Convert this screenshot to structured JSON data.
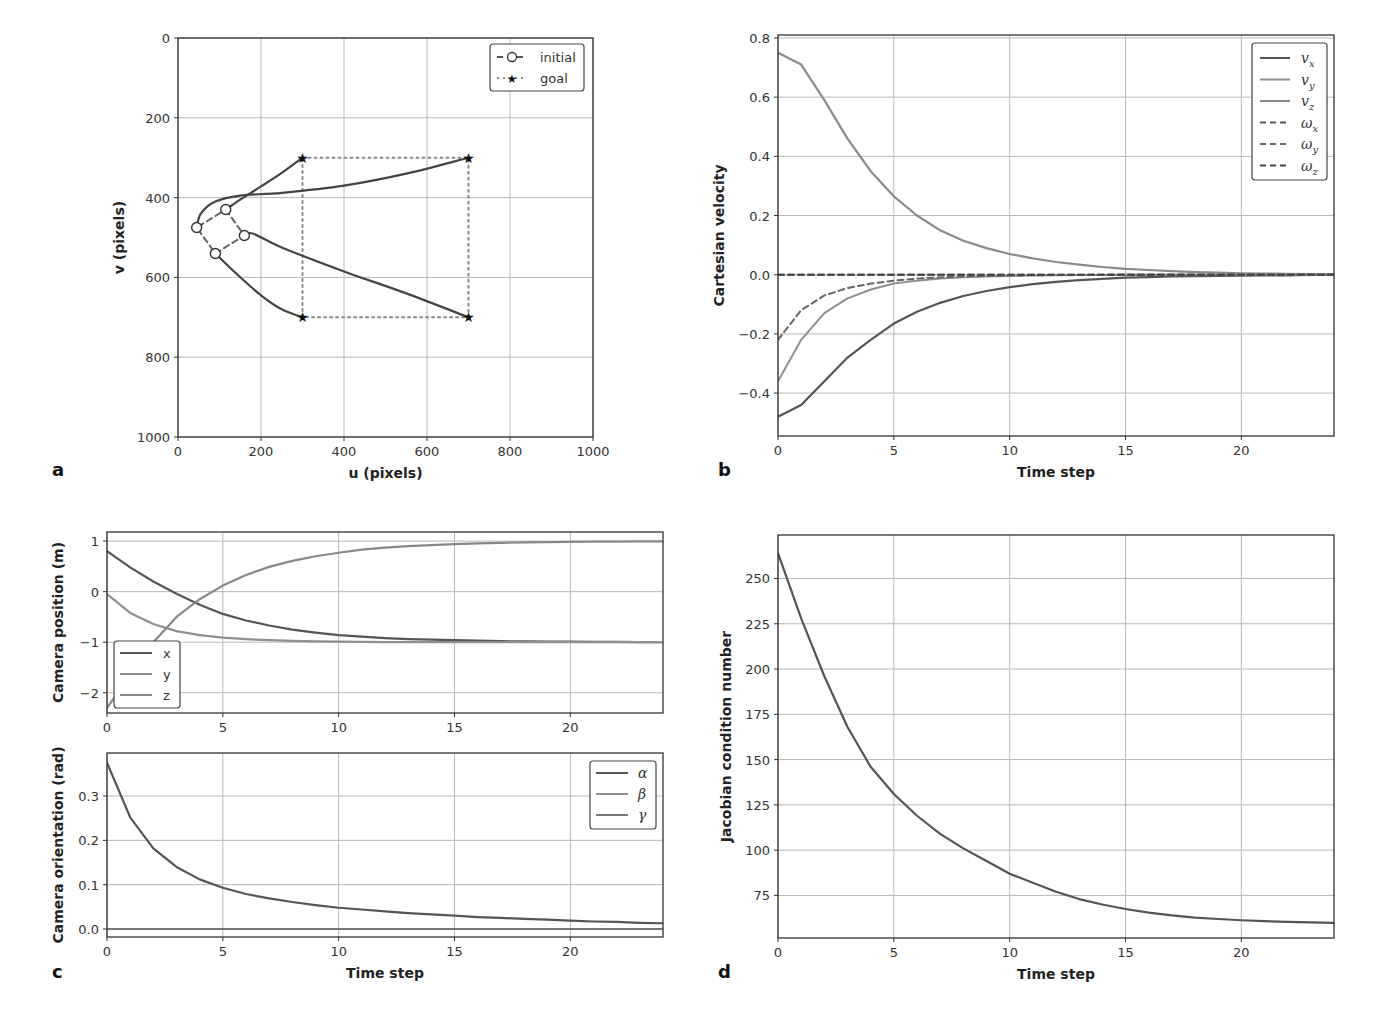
{
  "panels": {
    "a": {
      "letter": "a"
    },
    "b": {
      "letter": "b"
    },
    "c": {
      "letter": "c"
    },
    "d": {
      "letter": "d"
    }
  },
  "colors": {
    "dark": "#555555",
    "mid": "#777777",
    "light": "#8f8f8f",
    "grid": "#b8b8b8",
    "frame": "#333333"
  },
  "chart_data": [
    {
      "id": "a",
      "type": "line",
      "title": "",
      "xlabel": "u (pixels)",
      "ylabel": "v (pixels)",
      "xlim": [
        0,
        1000
      ],
      "ylim": [
        1000,
        0
      ],
      "y_inverted": true,
      "xticks": [
        "0",
        "200",
        "400",
        "600",
        "800",
        "1000"
      ],
      "yticks": [
        "0",
        "200",
        "400",
        "600",
        "800",
        "1000"
      ],
      "grid": true,
      "legend": {
        "position": "upper right",
        "entries": [
          "initial",
          "goal"
        ]
      },
      "initial_points": [
        [
          115,
          430
        ],
        [
          45,
          475
        ],
        [
          160,
          495
        ],
        [
          90,
          540
        ]
      ],
      "goal_points": [
        [
          300,
          300
        ],
        [
          700,
          300
        ],
        [
          300,
          700
        ],
        [
          700,
          700
        ]
      ],
      "trajectories": [
        {
          "name": "feature 1",
          "points": [
            [
              115,
              430
            ],
            [
              150,
              405
            ],
            [
              200,
              372
            ],
            [
              250,
              338
            ],
            [
              300,
              300
            ]
          ]
        },
        {
          "name": "feature 2",
          "points": [
            [
              45,
              475
            ],
            [
              55,
              440
            ],
            [
              90,
              410
            ],
            [
              150,
              395
            ],
            [
              250,
              388
            ],
            [
              400,
              370
            ],
            [
              550,
              340
            ],
            [
              700,
              300
            ]
          ]
        },
        {
          "name": "feature 3",
          "points": [
            [
              160,
              495
            ],
            [
              180,
              490
            ],
            [
              250,
              525
            ],
            [
              400,
              585
            ],
            [
              550,
              640
            ],
            [
              700,
              700
            ]
          ]
        },
        {
          "name": "feature 4",
          "points": [
            [
              90,
              540
            ],
            [
              140,
              590
            ],
            [
              200,
              645
            ],
            [
              250,
              680
            ],
            [
              300,
              700
            ]
          ]
        }
      ]
    },
    {
      "id": "b",
      "type": "line",
      "title": "",
      "xlabel": "Time step",
      "ylabel": "Cartesian velocity",
      "xlim": [
        0,
        24
      ],
      "ylim": [
        -0.545,
        0.81
      ],
      "xticks": [
        "0",
        "5",
        "10",
        "15",
        "20"
      ],
      "yticks": [
        "−0.4",
        "−0.2",
        "0.0",
        "0.2",
        "0.4",
        "0.6",
        "0.8"
      ],
      "grid": true,
      "legend": {
        "position": "upper right",
        "entries": [
          "v_x",
          "v_y",
          "v_z",
          "ω_x",
          "ω_y",
          "ω_z"
        ]
      },
      "x": [
        0,
        1,
        2,
        3,
        4,
        5,
        6,
        7,
        8,
        9,
        10,
        11,
        12,
        13,
        14,
        15,
        16,
        17,
        18,
        19,
        20,
        21,
        22,
        23,
        24
      ],
      "series": [
        {
          "name": "v_x",
          "style": "solid",
          "values": [
            -0.48,
            -0.44,
            -0.36,
            -0.28,
            -0.22,
            -0.165,
            -0.125,
            -0.095,
            -0.072,
            -0.055,
            -0.042,
            -0.032,
            -0.024,
            -0.018,
            -0.014,
            -0.01,
            -0.008,
            -0.006,
            -0.005,
            -0.004,
            -0.003,
            -0.002,
            -0.002,
            -0.001,
            -0.001
          ]
        },
        {
          "name": "v_y",
          "style": "solid",
          "values": [
            -0.36,
            -0.22,
            -0.13,
            -0.08,
            -0.05,
            -0.03,
            -0.02,
            -0.013,
            -0.009,
            -0.006,
            -0.004,
            -0.003,
            -0.002,
            -0.001,
            -0.001,
            0,
            0,
            0,
            0,
            0,
            0,
            0,
            0,
            0,
            0
          ]
        },
        {
          "name": "v_z",
          "style": "solid",
          "values": [
            0.75,
            0.71,
            0.59,
            0.46,
            0.35,
            0.265,
            0.2,
            0.15,
            0.115,
            0.09,
            0.07,
            0.055,
            0.043,
            0.034,
            0.026,
            0.02,
            0.016,
            0.012,
            0.009,
            0.007,
            0.005,
            0.004,
            0.003,
            0.002,
            0.002
          ]
        },
        {
          "name": "ω_x",
          "style": "dashed",
          "values": [
            0,
            0,
            0,
            0,
            0,
            0,
            0,
            0,
            0,
            0,
            0,
            0,
            0,
            0,
            0,
            0,
            0,
            0,
            0,
            0,
            0,
            0,
            0,
            0,
            0
          ]
        },
        {
          "name": "ω_y",
          "style": "dashed",
          "values": [
            -0.22,
            -0.12,
            -0.07,
            -0.045,
            -0.03,
            -0.02,
            -0.013,
            -0.009,
            -0.006,
            -0.004,
            -0.003,
            -0.002,
            -0.001,
            -0.001,
            0,
            0,
            0,
            0,
            0,
            0,
            0,
            0,
            0,
            0,
            0
          ]
        },
        {
          "name": "ω_z",
          "style": "dashed",
          "values": [
            0,
            0,
            0,
            0,
            0,
            0,
            0,
            0,
            0,
            0,
            0,
            0,
            0,
            0,
            0,
            0,
            0,
            0,
            0,
            0,
            0,
            0,
            0,
            0,
            0
          ]
        }
      ]
    },
    {
      "id": "c_top",
      "type": "line",
      "title": "",
      "xlabel": "",
      "ylabel": "Camera position (m)",
      "xlim": [
        0,
        24
      ],
      "ylim": [
        -2.4,
        1.18
      ],
      "xticks": [
        "0",
        "5",
        "10",
        "15",
        "20"
      ],
      "yticks": [
        "−2",
        "−1",
        "0",
        "1"
      ],
      "grid": true,
      "legend": {
        "position": "lower left",
        "entries": [
          "x",
          "y",
          "z"
        ]
      },
      "x": [
        0,
        1,
        2,
        3,
        4,
        5,
        6,
        7,
        8,
        9,
        10,
        11,
        12,
        13,
        14,
        15,
        16,
        17,
        18,
        19,
        20,
        21,
        22,
        23,
        24
      ],
      "series": [
        {
          "name": "x",
          "values": [
            0.8,
            0.48,
            0.2,
            -0.04,
            -0.26,
            -0.44,
            -0.57,
            -0.67,
            -0.75,
            -0.81,
            -0.86,
            -0.89,
            -0.92,
            -0.94,
            -0.95,
            -0.96,
            -0.97,
            -0.98,
            -0.985,
            -0.99,
            -0.99,
            -0.995,
            -0.995,
            -1.0,
            -1.0
          ]
        },
        {
          "name": "y",
          "values": [
            -0.05,
            -0.42,
            -0.64,
            -0.78,
            -0.86,
            -0.91,
            -0.94,
            -0.96,
            -0.975,
            -0.985,
            -0.99,
            -0.995,
            -1.0,
            -1.0,
            -1.0,
            -1.0,
            -1.0,
            -1.0,
            -1.0,
            -1.0,
            -1.0,
            -1.0,
            -1.0,
            -1.0,
            -1.0
          ]
        },
        {
          "name": "z",
          "values": [
            -2.3,
            -1.65,
            -1.0,
            -0.5,
            -0.15,
            0.12,
            0.33,
            0.49,
            0.61,
            0.7,
            0.77,
            0.83,
            0.87,
            0.9,
            0.92,
            0.94,
            0.955,
            0.965,
            0.975,
            0.98,
            0.985,
            0.99,
            0.99,
            0.995,
            0.995
          ]
        }
      ]
    },
    {
      "id": "c_bottom",
      "type": "line",
      "title": "",
      "xlabel": "Time step",
      "ylabel": "Camera orientation (rad)",
      "xlim": [
        0,
        24
      ],
      "ylim": [
        -0.018,
        0.397
      ],
      "xticks": [
        "0",
        "5",
        "10",
        "15",
        "20"
      ],
      "yticks": [
        "0.0",
        "0.1",
        "0.2",
        "0.3"
      ],
      "grid": true,
      "legend": {
        "position": "upper right",
        "entries": [
          "α",
          "β",
          "γ"
        ]
      },
      "x": [
        0,
        1,
        2,
        3,
        4,
        5,
        6,
        7,
        8,
        9,
        10,
        11,
        12,
        13,
        14,
        15,
        16,
        17,
        18,
        19,
        20,
        21,
        22,
        23,
        24
      ],
      "series": [
        {
          "name": "α",
          "values": [
            0.375,
            0.252,
            0.182,
            0.14,
            0.112,
            0.093,
            0.079,
            0.069,
            0.061,
            0.054,
            0.048,
            0.044,
            0.04,
            0.036,
            0.033,
            0.03,
            0.027,
            0.025,
            0.023,
            0.021,
            0.019,
            0.017,
            0.016,
            0.014,
            0.013
          ]
        },
        {
          "name": "β",
          "values": [
            0,
            0,
            0,
            0,
            0,
            0,
            0,
            0,
            0,
            0,
            0,
            0,
            0,
            0,
            0,
            0,
            0,
            0,
            0,
            0,
            0,
            0,
            0,
            0,
            0
          ]
        },
        {
          "name": "γ",
          "values": [
            0,
            0,
            0,
            0,
            0,
            0,
            0,
            0,
            0,
            0,
            0,
            0,
            0,
            0,
            0,
            0,
            0,
            0,
            0,
            0,
            0,
            0,
            0,
            0,
            0
          ]
        }
      ]
    },
    {
      "id": "d",
      "type": "line",
      "title": "",
      "xlabel": "Time step",
      "ylabel": "Jacobian condition number",
      "xlim": [
        0,
        24
      ],
      "ylim": [
        51.5,
        274
      ],
      "xticks": [
        "0",
        "5",
        "10",
        "15",
        "20"
      ],
      "yticks": [
        "75",
        "100",
        "125",
        "150",
        "175",
        "200",
        "225",
        "250"
      ],
      "grid": true,
      "x": [
        0,
        1,
        2,
        3,
        4,
        5,
        6,
        7,
        8,
        9,
        10,
        11,
        12,
        13,
        14,
        15,
        16,
        17,
        18,
        19,
        20,
        21,
        22,
        23,
        24
      ],
      "series": [
        {
          "name": "condition number",
          "values": [
            264,
            228,
            196,
            168,
            146,
            131,
            119,
            109,
            101,
            94,
            87,
            82,
            77,
            73,
            70,
            67.5,
            65.5,
            64,
            62.8,
            62,
            61.3,
            60.8,
            60.4,
            60.1,
            59.8
          ]
        }
      ]
    }
  ]
}
